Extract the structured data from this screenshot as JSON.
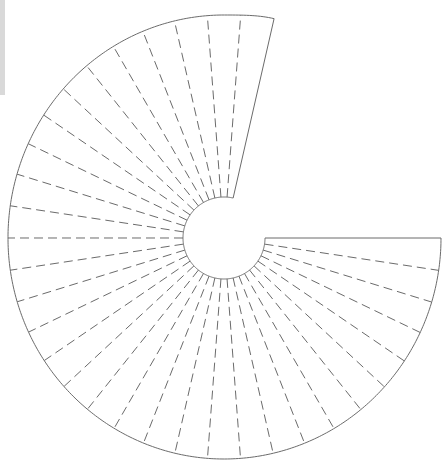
{
  "diagram": {
    "title": "",
    "type": "spiral fan template with radial fold lines",
    "center": [
      224,
      238
    ],
    "inner_radius": 41,
    "outer_radius_samples": [
      {
        "angle_deg": 0,
        "r": 217
      },
      {
        "angle_deg": 90,
        "r": 221
      },
      {
        "angle_deg": 180,
        "r": 216
      },
      {
        "angle_deg": 270,
        "r": 223
      },
      {
        "angle_deg": 282.86,
        "r": 225
      }
    ],
    "start_angle_deg": 0,
    "sweep_deg": 282.86,
    "segments": 33,
    "dashed_spokes": 32,
    "solid_edges": 2,
    "colors": {
      "outline": "#6b6b6b",
      "dash": "#6b6b6b",
      "background": "#ffffff",
      "edge_bar": "#d9d9d9"
    }
  }
}
